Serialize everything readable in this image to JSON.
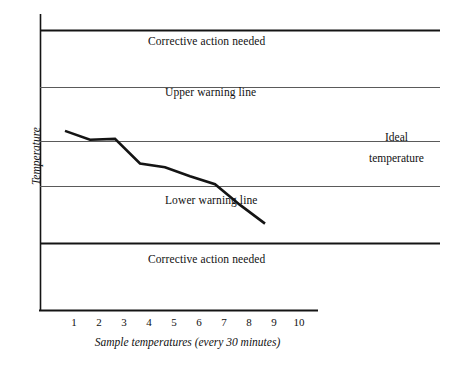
{
  "chart_data": {
    "type": "line",
    "title": "",
    "xlabel": "Sample temperatures (every 30 minutes)",
    "ylabel": "Temperature",
    "grid": false,
    "legend_position": "none",
    "xlim": [
      0,
      11
    ],
    "ylim": [
      0,
      10
    ],
    "x_tick_labels": [
      "1",
      "2",
      "3",
      "4",
      "5",
      "6",
      "7",
      "8",
      "9",
      "10"
    ],
    "x": [
      1,
      2,
      3,
      4,
      5,
      6,
      7,
      8,
      9
    ],
    "categories": [
      "1",
      "2",
      "3",
      "4",
      "5",
      "6",
      "7",
      "8",
      "9"
    ],
    "series": [
      {
        "name": "Sample temperature",
        "values": [
          6.05,
          5.75,
          5.78,
          4.95,
          4.82,
          4.52,
          4.25,
          3.55,
          2.92
        ],
        "color": "#141414"
      }
    ],
    "reference_lines": [
      {
        "id": "upper-corrective",
        "label": "Corrective action needed",
        "value": 9.45,
        "weight": "thick",
        "color": "#141414",
        "label_position": "above"
      },
      {
        "id": "upper-warning",
        "label": "Upper warning line",
        "value": 7.55,
        "weight": "thin",
        "color": "#5a5a5a",
        "label_position": "above"
      },
      {
        "id": "ideal",
        "label_top": "Ideal",
        "label_bottom": "temperature",
        "value": 5.7,
        "weight": "thin",
        "color": "#5a5a5a",
        "label_position": "right"
      },
      {
        "id": "lower-warning",
        "label": "Lower warning line",
        "value": 4.2,
        "weight": "thin",
        "color": "#5a5a5a",
        "label_position": "below"
      },
      {
        "id": "lower-corrective",
        "label": "Corrective action needed",
        "value": 2.25,
        "weight": "thick",
        "color": "#141414",
        "label_position": "below"
      }
    ]
  },
  "labels": {
    "upper_corrective": "Corrective action needed",
    "upper_warning": "Upper warning line",
    "ideal_top": "Ideal",
    "ideal_bottom": "temperature",
    "lower_warning": "Lower warning line",
    "lower_corrective": "Corrective action needed",
    "y_axis_title": "Temperature",
    "x_axis_title": "Sample temperatures (every 30 minutes)"
  },
  "ticks": {
    "x": [
      "1",
      "2",
      "3",
      "4",
      "5",
      "6",
      "7",
      "8",
      "9",
      "10"
    ]
  },
  "colors": {
    "axis": "#141414",
    "thick_line": "#141414",
    "thin_line": "#5a5a5a",
    "data_line": "#141414",
    "background": "#ffffff",
    "text": "#111111"
  }
}
